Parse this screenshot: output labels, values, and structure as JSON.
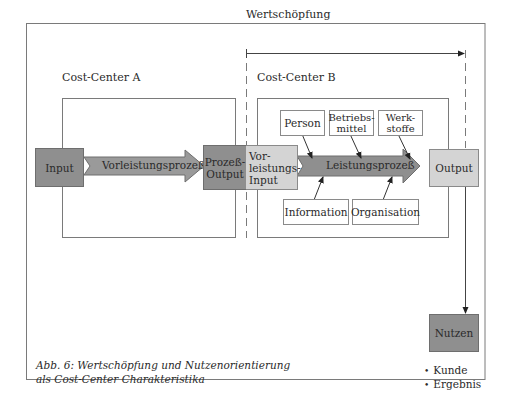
{
  "diagram": {
    "value_creation_label": "Wertschöpfung",
    "cost_center_a_label": "Cost-Center A",
    "cost_center_b_label": "Cost-Center B",
    "input_label": "Input",
    "pre_process_label": "Vorleistungsprozeß",
    "process_output_label": "Prozeß-\nOutput",
    "pre_input_label": "Vor-\nleistungs-\nInput",
    "main_process_label": "Leistungsprozeß",
    "output_label": "Output",
    "resources_top": [
      "Person",
      "Betriebs-\nmittel",
      "Werk-\nstoffe"
    ],
    "resources_bottom": [
      "Information",
      "Organisation"
    ],
    "benefit_label": "Nutzen",
    "benefit_items": [
      "Kunde",
      "Ergebnis"
    ],
    "caption_line1": "Abb. 6: Wertschöpfung und Nutzenorientierung",
    "caption_line2": "als Cost-Center Charakteristika"
  }
}
